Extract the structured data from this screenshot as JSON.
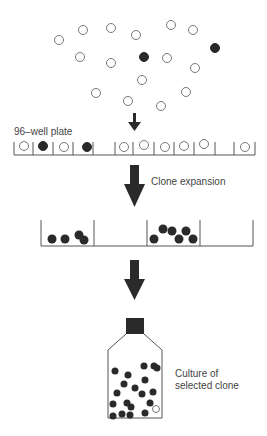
{
  "labels": {
    "plate": "96–well plate",
    "expansion": "Clone expansion",
    "culture_line1": "Culture of",
    "culture_line2": "selected clone"
  },
  "colors": {
    "ink": "#2a2a2a",
    "outline": "#777777"
  },
  "stages": [
    {
      "name": "cell-suspension",
      "description": "Mixed population of open and filled cells"
    },
    {
      "name": "96-well-plate",
      "description": "Single cells distributed into wells"
    },
    {
      "name": "clone-expansion",
      "description": "Wells with expanded clones"
    },
    {
      "name": "culture-flask",
      "description": "Culture of selected clone"
    }
  ]
}
